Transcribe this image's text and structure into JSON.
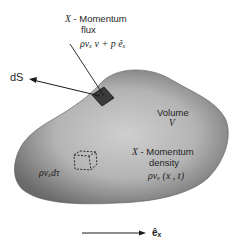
{
  "diagram": {
    "flux_label": {
      "line1_var": "X",
      "line1_text": " - Momentum",
      "line2": "flux",
      "formula": "ρvₓ v + p êₓ"
    },
    "surface_element": {
      "label": "dS"
    },
    "volume_label": {
      "line1": "Volume",
      "line2": "V"
    },
    "density_label": {
      "line1_var": "X",
      "line1_text": " - Momentum",
      "line2": "density",
      "formula": "ρvₓ (x , t)"
    },
    "element_label": {
      "formula": "ρvₓdτ"
    },
    "axis_label": {
      "text": "êₓ"
    },
    "colors": {
      "blob_fill_center": "#c9c9c9",
      "blob_fill_edge": "#6e6e6e",
      "patch_fill": "#3a3a3a",
      "line": "#1a1a1a",
      "background": "#ffffff"
    }
  }
}
